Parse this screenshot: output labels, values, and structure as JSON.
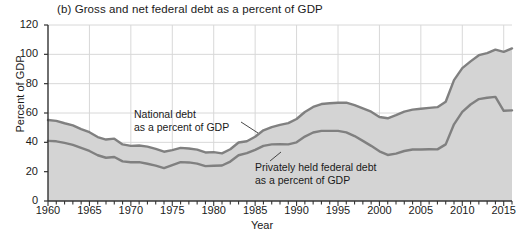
{
  "figure": {
    "panel_label": "(b) Gross and net federal debt as a percent of GDP",
    "xlabel": "Year",
    "ylabel": "Percent of GDP",
    "annotation_national": [
      "National debt",
      "as a percent of GDP"
    ],
    "annotation_private": [
      "Privately held federal debt",
      "as a percent of GDP"
    ],
    "colors": {
      "fill": "#d4d4d4",
      "line": "#808080",
      "axis": "#333333",
      "grid": "#d8d8d8",
      "background": "#ffffff"
    }
  },
  "chart_data": {
    "type": "area",
    "title": "(b) Gross and net federal debt as a percent of GDP",
    "xlabel": "Year",
    "ylabel": "Percent of GDP",
    "xlim": [
      1960,
      2016
    ],
    "ylim": [
      0,
      120
    ],
    "yticks": [
      0,
      20,
      40,
      60,
      80,
      100,
      120
    ],
    "xticks": [
      1960,
      1965,
      1970,
      1975,
      1980,
      1985,
      1990,
      1995,
      2000,
      2005,
      2010,
      2015
    ],
    "xtick_minor_step": 1,
    "grid": true,
    "legend": "annotations-inline",
    "x": [
      1960,
      1961,
      1962,
      1963,
      1964,
      1965,
      1966,
      1967,
      1968,
      1969,
      1970,
      1971,
      1972,
      1973,
      1974,
      1975,
      1976,
      1977,
      1978,
      1979,
      1980,
      1981,
      1982,
      1983,
      1984,
      1985,
      1986,
      1987,
      1988,
      1989,
      1990,
      1991,
      1992,
      1993,
      1994,
      1995,
      1996,
      1997,
      1998,
      1999,
      2000,
      2001,
      2002,
      2003,
      2004,
      2005,
      2006,
      2007,
      2008,
      2009,
      2010,
      2011,
      2012,
      2013,
      2014,
      2015,
      2016
    ],
    "series": [
      {
        "name": "National debt as a percent of GDP",
        "values": [
          55.2,
          54.6,
          53.0,
          51.6,
          49.0,
          46.9,
          43.6,
          41.9,
          42.5,
          38.6,
          37.6,
          37.8,
          37.1,
          35.6,
          33.6,
          34.7,
          36.2,
          35.8,
          35.0,
          33.1,
          33.3,
          32.5,
          35.3,
          39.9,
          40.7,
          43.8,
          48.2,
          50.4,
          51.9,
          53.1,
          55.9,
          60.7,
          64.1,
          66.1,
          66.6,
          67.0,
          67.1,
          65.4,
          63.2,
          60.9,
          57.3,
          56.4,
          58.5,
          60.9,
          62.3,
          62.9,
          63.5,
          64.0,
          67.7,
          82.4,
          90.6,
          95.2,
          99.4,
          100.8,
          103.2,
          101.7,
          104.0
        ],
        "fill_to_baseline": true
      },
      {
        "name": "Privately held federal debt as a percent of GDP",
        "values": [
          41.0,
          40.7,
          39.6,
          38.3,
          36.2,
          34.1,
          31.2,
          29.5,
          30.0,
          27.0,
          26.4,
          26.5,
          25.4,
          24.1,
          22.4,
          24.5,
          26.5,
          26.3,
          25.5,
          23.8,
          24.0,
          24.2,
          26.9,
          31.2,
          32.6,
          34.9,
          37.6,
          38.6,
          38.8,
          38.6,
          40.0,
          43.9,
          46.7,
          47.8,
          47.8,
          47.8,
          46.8,
          44.3,
          41.0,
          37.6,
          33.9,
          31.4,
          32.3,
          34.1,
          35.1,
          35.1,
          35.3,
          35.2,
          38.6,
          52.3,
          60.8,
          65.8,
          69.5,
          70.4,
          71.0,
          61.5,
          61.8
        ],
        "fill_to_baseline": true
      }
    ]
  }
}
